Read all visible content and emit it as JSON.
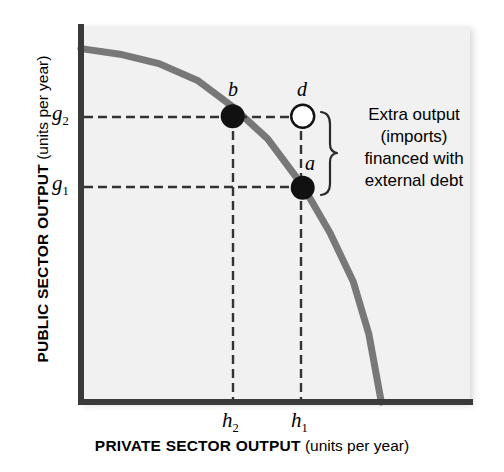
{
  "chart_data": {
    "type": "line",
    "title": "",
    "subtitle": "",
    "xlabel_bold": "PRIVATE SECTOR OUTPUT",
    "xlabel_paren": "(units per year)",
    "ylabel_bold": "PUBLIC SECTOR OUTPUT",
    "ylabel_paren": "(units per year)",
    "grid": false,
    "legend": "none",
    "xlim": [
      0,
      1
    ],
    "ylim": [
      0,
      1
    ],
    "x_ticks": [
      {
        "label": "h",
        "sub": "2",
        "value": 0.39
      },
      {
        "label": "h",
        "sub": "1",
        "value": 0.57
      }
    ],
    "y_ticks": [
      {
        "label": "g",
        "sub": "2",
        "value": 0.76
      },
      {
        "label": "g",
        "sub": "1",
        "value": 0.57
      }
    ],
    "series": [
      {
        "name": "production possibility frontier",
        "color": "#787878",
        "style": "solid",
        "width": 7,
        "points": [
          [
            0.0,
            0.94
          ],
          [
            0.1,
            0.925
          ],
          [
            0.2,
            0.9
          ],
          [
            0.3,
            0.855
          ],
          [
            0.39,
            0.785
          ],
          [
            0.48,
            0.7
          ],
          [
            0.57,
            0.575
          ],
          [
            0.64,
            0.45
          ],
          [
            0.7,
            0.32
          ],
          [
            0.74,
            0.18
          ],
          [
            0.772,
            0.0
          ]
        ]
      }
    ],
    "points": [
      {
        "id": "b",
        "label": "b",
        "x": 0.39,
        "y": 0.76,
        "fill": "filled",
        "color": "#111111"
      },
      {
        "id": "d",
        "label": "d",
        "x": 0.57,
        "y": 0.76,
        "fill": "hollow",
        "color": "#ffffff"
      },
      {
        "id": "a",
        "label": "a",
        "x": 0.57,
        "y": 0.57,
        "fill": "filled",
        "color": "#111111"
      }
    ],
    "guide_lines": [
      {
        "from": "y-axis",
        "to": "point-d",
        "orientation": "horizontal",
        "value": 0.76,
        "style": "dashed"
      },
      {
        "from": "y-axis",
        "to": "point-a",
        "orientation": "horizontal",
        "value": 0.57,
        "style": "dashed"
      },
      {
        "from": "x-axis",
        "to": "point-b",
        "orientation": "vertical",
        "value": 0.39,
        "style": "dashed"
      },
      {
        "from": "x-axis",
        "to": "point-d",
        "orientation": "vertical",
        "value": 0.57,
        "style": "dashed"
      }
    ],
    "annotations": [
      {
        "type": "brace",
        "spans_points": [
          "d",
          "a"
        ],
        "lines": [
          "Extra output",
          "(imports)",
          "financed with",
          "external debt"
        ]
      }
    ],
    "colors": {
      "curve": "#787878",
      "axis": "#3a3a3a",
      "plot_bg": "#f1f1f1",
      "page_bg": "#ffffff",
      "dash": "#333333",
      "point_fill": "#111111",
      "point_hollow": "#ffffff"
    }
  },
  "annotation": {
    "line1": "Extra output",
    "line2": "(imports)",
    "line3": "financed with",
    "line4": "external debt"
  },
  "axes": {
    "y_bold": "PUBLIC SECTOR OUTPUT",
    "y_paren": "(units per year)",
    "x_bold": "PRIVATE SECTOR OUTPUT",
    "x_paren": "(units per year)"
  },
  "ticks": {
    "g2": "g",
    "g2_sub": "2",
    "g1": "g",
    "g1_sub": "1",
    "h2": "h",
    "h2_sub": "2",
    "h1": "h",
    "h1_sub": "1"
  },
  "point_labels": {
    "b": "b",
    "d": "d",
    "a": "a"
  }
}
